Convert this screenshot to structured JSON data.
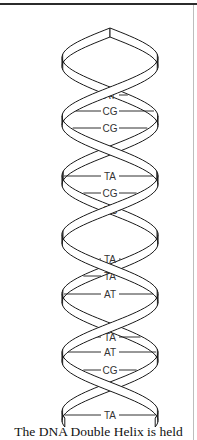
{
  "figure": {
    "caption": "The DNA Double Helix is held",
    "base_pairs": [
      {
        "label": "AT"
      },
      {
        "label": "CG"
      },
      {
        "label": "CG"
      },
      {
        "label": "TA"
      },
      {
        "label": "CG"
      },
      {
        "label": "GC"
      },
      {
        "label": "TA"
      },
      {
        "label": "TA"
      },
      {
        "label": "AT"
      },
      {
        "label": "TA"
      },
      {
        "label": "AT"
      },
      {
        "label": "CG"
      },
      {
        "label": "TA"
      }
    ],
    "colors": {
      "ink": "#1a1a1a",
      "label": "#333333",
      "ribbon_fill": "#ffffff"
    }
  }
}
